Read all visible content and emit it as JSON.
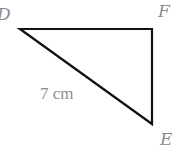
{
  "diagram": {
    "type": "right-triangle",
    "vertices": [
      {
        "name": "D",
        "x": 20,
        "y": 29
      },
      {
        "name": "F",
        "x": 152,
        "y": 29
      },
      {
        "name": "E",
        "x": 152,
        "y": 124
      }
    ],
    "labels": {
      "d": "D",
      "f": "F",
      "e": "E",
      "hypotenuse": "7 cm"
    },
    "edges": [
      {
        "from": "D",
        "to": "F"
      },
      {
        "from": "F",
        "to": "E"
      },
      {
        "from": "E",
        "to": "D",
        "length_label": "7 cm"
      }
    ],
    "colors": {
      "stroke": "#111111",
      "label_text": "#8a8a8a",
      "background": "#ffffff"
    }
  }
}
